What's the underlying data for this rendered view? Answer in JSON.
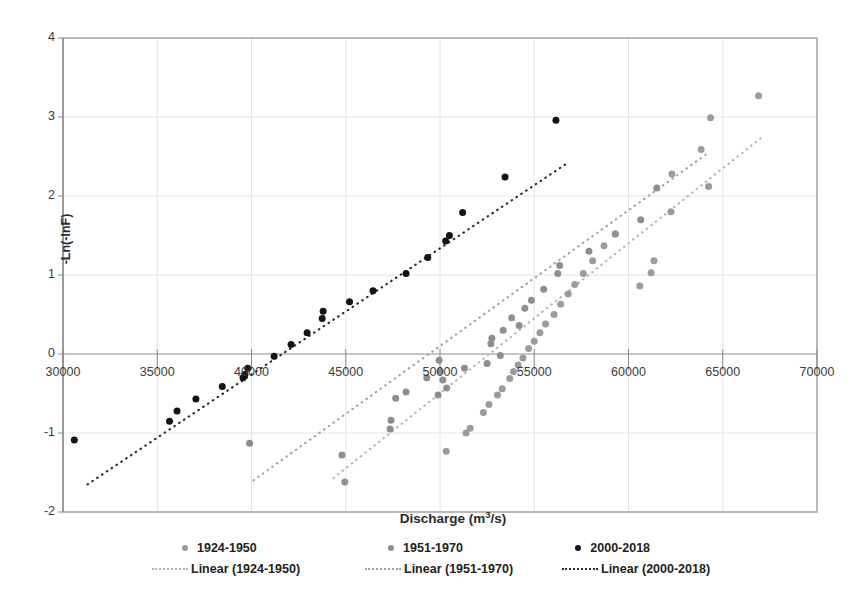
{
  "chart_data": {
    "type": "scatter",
    "title": "",
    "xlabel": "Discharge (m³/s)",
    "xlabel_html": "Discharge (m<sup>3</sup>/s)",
    "ylabel": "-Ln(-lnF)",
    "xlim": [
      30000,
      70000
    ],
    "ylim": [
      -2,
      4
    ],
    "xticks": [
      30000,
      35000,
      40000,
      45000,
      50000,
      55000,
      60000,
      65000,
      70000
    ],
    "yticks": [
      -2,
      -1,
      0,
      1,
      2,
      3,
      4
    ],
    "xtick_labels": [
      "30000",
      "35000",
      "40000",
      "45000",
      "50000",
      "55000",
      "60000",
      "65000",
      "70000"
    ],
    "ytick_labels": [
      "-2",
      "-1",
      "0",
      "1",
      "2",
      "3",
      "4"
    ],
    "grid": true,
    "grid_color": "#e4e4e4",
    "plot_border_color": "#8c8c8c",
    "legend_position": "bottom",
    "series": [
      {
        "name": "1924-1950",
        "marker_color": "#9b9b9b",
        "marker_size": 7,
        "points": [
          [
            50330,
            -1.23
          ],
          [
            51380,
            -1.0
          ],
          [
            51600,
            -0.94
          ],
          [
            52300,
            -0.74
          ],
          [
            52600,
            -0.64
          ],
          [
            53050,
            -0.52
          ],
          [
            53300,
            -0.44
          ],
          [
            53700,
            -0.31
          ],
          [
            53900,
            -0.22
          ],
          [
            54150,
            -0.14
          ],
          [
            54400,
            -0.05
          ],
          [
            54700,
            0.07
          ],
          [
            55000,
            0.16
          ],
          [
            55300,
            0.27
          ],
          [
            55600,
            0.38
          ],
          [
            56050,
            0.5
          ],
          [
            56400,
            0.63
          ],
          [
            56800,
            0.76
          ],
          [
            57150,
            0.88
          ],
          [
            57600,
            1.02
          ],
          [
            58100,
            1.18
          ],
          [
            58700,
            1.37
          ],
          [
            59300,
            1.52
          ],
          [
            60600,
            0.86
          ],
          [
            61200,
            1.03
          ],
          [
            61350,
            1.18
          ],
          [
            62250,
            1.8
          ],
          [
            62300,
            2.28
          ],
          [
            63850,
            2.59
          ],
          [
            64250,
            2.12
          ],
          [
            64350,
            2.99
          ],
          [
            66900,
            3.27
          ]
        ]
      },
      {
        "name": "1951-1970",
        "marker_color": "#8e8e8e",
        "marker_size": 7,
        "points": [
          [
            39900,
            -1.13
          ],
          [
            44800,
            -1.28
          ],
          [
            44950,
            -1.62
          ],
          [
            47350,
            -0.95
          ],
          [
            47400,
            -0.84
          ],
          [
            47650,
            -0.56
          ],
          [
            48200,
            -0.48
          ],
          [
            49300,
            -0.3
          ],
          [
            49900,
            -0.52
          ],
          [
            49950,
            -0.08
          ],
          [
            50000,
            -0.22
          ],
          [
            50150,
            -0.33
          ],
          [
            50350,
            -0.43
          ],
          [
            51300,
            -0.18
          ],
          [
            52500,
            -0.12
          ],
          [
            52700,
            0.13
          ],
          [
            52750,
            0.2
          ],
          [
            53200,
            -0.02
          ],
          [
            53350,
            0.3
          ],
          [
            53800,
            0.46
          ],
          [
            54200,
            0.36
          ],
          [
            54500,
            0.58
          ],
          [
            54850,
            0.68
          ],
          [
            55500,
            0.82
          ],
          [
            56250,
            1.02
          ],
          [
            56350,
            1.12
          ],
          [
            57900,
            1.3
          ],
          [
            59300,
            1.52
          ],
          [
            60650,
            1.7
          ],
          [
            61500,
            2.1
          ]
        ]
      },
      {
        "name": "2000-2018",
        "marker_color": "#141414",
        "marker_size": 7,
        "points": [
          [
            30600,
            -1.09
          ],
          [
            35650,
            -0.85
          ],
          [
            36050,
            -0.72
          ],
          [
            37050,
            -0.57
          ],
          [
            38450,
            -0.41
          ],
          [
            39550,
            -0.3
          ],
          [
            39650,
            -0.26
          ],
          [
            39800,
            -0.18
          ],
          [
            41200,
            -0.03
          ],
          [
            42100,
            0.12
          ],
          [
            42950,
            0.27
          ],
          [
            43750,
            0.45
          ],
          [
            43800,
            0.54
          ],
          [
            45200,
            0.66
          ],
          [
            46450,
            0.8
          ],
          [
            48200,
            1.02
          ],
          [
            49350,
            1.22
          ],
          [
            50300,
            1.43
          ],
          [
            50500,
            1.5
          ],
          [
            51200,
            1.79
          ],
          [
            53450,
            2.24
          ],
          [
            56150,
            2.96
          ]
        ]
      }
    ],
    "trendlines": [
      {
        "name": "Linear (1924-1950)",
        "color": "#b5b5b5",
        "style": "dotted",
        "x_start": 44350,
        "y_start": -1.57,
        "x_end": 67000,
        "y_end": 2.73
      },
      {
        "name": "Linear (1951-1970)",
        "color": "#a0a0a0",
        "style": "dotted",
        "x_start": 40100,
        "y_start": -1.6,
        "x_end": 64250,
        "y_end": 2.55
      },
      {
        "name": "Linear (2000-2018)",
        "color": "#2a2a2a",
        "style": "dotted",
        "x_start": 31300,
        "y_start": -1.65,
        "x_end": 56650,
        "y_end": 2.4
      }
    ]
  },
  "legend": {
    "series_entries": [
      {
        "label": "1924-1950",
        "color": "#9b9b9b"
      },
      {
        "label": "1951-1970",
        "color": "#8e8e8e"
      },
      {
        "label": "2000-2018",
        "color": "#141414"
      }
    ],
    "trend_entries": [
      {
        "label": "Linear (1924-1950)",
        "color": "#b5b5b5"
      },
      {
        "label": "Linear (1951-1970)",
        "color": "#a0a0a0"
      },
      {
        "label": "Linear (2000-2018)",
        "color": "#2a2a2a"
      }
    ]
  }
}
